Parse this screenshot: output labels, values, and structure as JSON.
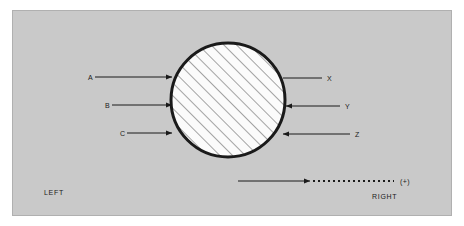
{
  "figure": {
    "title": "",
    "background_color": "#ffffff",
    "panel_color": "#c9c9c9",
    "panel_border_color": "#b0b0b0",
    "stroke_color": "#1a1a1a",
    "body_fill_color": "#fbfbfb",
    "hatch_color": "#5a5a5a"
  },
  "body": {
    "shape": "circle",
    "center_x": 228,
    "center_y": 100,
    "radius": 57,
    "fill": "hatched",
    "border_width": 3
  },
  "inputs": [
    {
      "label": "A",
      "label_x": 88,
      "y": 77,
      "line_start_x": 95,
      "line_end_x": 172,
      "arrow": "right"
    },
    {
      "label": "B",
      "label_x": 105,
      "y": 105,
      "line_start_x": 112,
      "line_end_x": 172,
      "arrow": "right"
    },
    {
      "label": "C",
      "label_x": 120,
      "y": 133,
      "line_start_x": 127,
      "line_end_x": 172,
      "arrow": "right"
    }
  ],
  "outputs": [
    {
      "label": "X",
      "label_x": 327,
      "y": 78,
      "line_start_x": 283,
      "line_end_x": 322,
      "arrow": "none"
    },
    {
      "label": "Y",
      "label_x": 345,
      "y": 106,
      "line_start_x": 286,
      "line_end_x": 340,
      "arrow": "left"
    },
    {
      "label": "Z",
      "label_x": 355,
      "y": 134,
      "line_start_x": 283,
      "line_end_x": 350,
      "arrow": "left"
    }
  ],
  "scale_arrow": {
    "solid_start_x": 238,
    "solid_end_x": 310,
    "dotted_start_x": 313,
    "dotted_end_x": 394,
    "y": 181,
    "arrow": "right",
    "end_label": "(+)",
    "end_label_x": 400
  },
  "corner_labels": {
    "left": "LEFT",
    "left_x": 44,
    "left_y": 192,
    "right": "RIGHT",
    "right_x": 372,
    "right_y": 196
  }
}
